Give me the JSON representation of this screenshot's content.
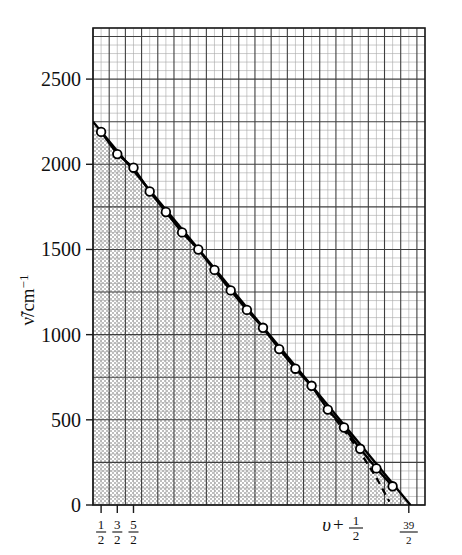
{
  "chart_data": {
    "type": "line",
    "title": "",
    "subtitle": "",
    "xlabel": "υ + 1/2",
    "ylabel": "ν̃/cm⁻¹",
    "xlabel_parts": {
      "symbol": "υ",
      "plus": "+",
      "num": "1",
      "den": "2"
    },
    "ylabel_parts": {
      "symbol": "ν̃",
      "unit": "/cm",
      "exponent": "−1"
    },
    "grid": true,
    "grid_minor": true,
    "legend": "none",
    "xlim": [
      0.0,
      20.5
    ],
    "ylim": [
      0,
      2800
    ],
    "ytick_labels": [
      "0",
      "500",
      "1000",
      "1500",
      "2000",
      "2500"
    ],
    "ytick_values": [
      0,
      500,
      1000,
      1500,
      2000,
      2500
    ],
    "xtick_labels": [
      "1/2",
      "3/2",
      "5/2",
      "39/2"
    ],
    "xtick_fractions": [
      {
        "num": "1",
        "den": "2",
        "x": 0.5
      },
      {
        "num": "3",
        "den": "2",
        "x": 1.5
      },
      {
        "num": "5",
        "den": "2",
        "x": 2.5
      },
      {
        "num": "39",
        "den": "2",
        "x": 19.5
      }
    ],
    "categories": [
      0.5,
      1.5,
      2.5,
      3.5,
      4.5,
      5.5,
      6.5,
      7.5,
      8.5,
      9.5,
      10.5,
      11.5,
      12.5,
      13.5,
      14.5,
      15.5,
      16.5,
      17.5,
      18.5
    ],
    "series": [
      {
        "name": "measured intervals",
        "marker": "open-circle",
        "style": "solid",
        "values": [
          2190,
          2060,
          1980,
          1840,
          1720,
          1600,
          1500,
          1380,
          1260,
          1145,
          1040,
          915,
          800,
          700,
          560,
          455,
          330,
          215,
          110
        ]
      },
      {
        "name": "linear extrapolation",
        "marker": "none",
        "style": "solid",
        "x": [
          0.0,
          19.6
        ],
        "values": [
          2250,
          0
        ]
      },
      {
        "name": "dashed extrapolation",
        "marker": "none",
        "style": "dashed",
        "x": [
          14.5,
          15.5,
          16.5,
          17.5,
          18.3
        ],
        "values": [
          560,
          440,
          310,
          160,
          20
        ]
      }
    ],
    "shaded_region": {
      "description": "stippled area under the data curve",
      "pattern": "stipple",
      "color": "#c9c9c9"
    },
    "annotations": []
  },
  "figure": {
    "background": "#ffffff",
    "line_color": "#000000",
    "grid_major_color": "#4a4a4a",
    "grid_minor_color": "#9a9a9a",
    "marker_fill": "#ffffff"
  }
}
